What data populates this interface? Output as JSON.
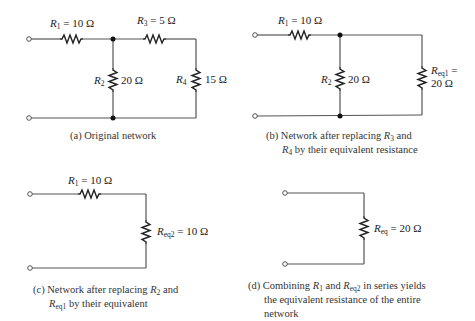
{
  "panels": [
    {
      "id": "a",
      "caption": "(a) Original network",
      "resistors": [
        {
          "name": "R1",
          "value": "10 Ω",
          "label": "R1 = 10 Ω"
        },
        {
          "name": "R2",
          "value": "20 Ω",
          "label": "R2 20 Ω"
        },
        {
          "name": "R3",
          "value": "5 Ω",
          "label": "R3 = 5 Ω"
        },
        {
          "name": "R4",
          "value": "15 Ω",
          "label": "R4 15 Ω"
        }
      ]
    },
    {
      "id": "b",
      "caption_line1": "(b) Network after replacing R3 and",
      "caption_line2": "R4 by their equivalent resistance",
      "resistors": [
        {
          "name": "R1",
          "value": "10 Ω"
        },
        {
          "name": "R2",
          "value": "20 Ω"
        },
        {
          "name": "Req1",
          "value": "20 Ω"
        }
      ]
    },
    {
      "id": "c",
      "caption_line1": "(c) Network after replacing R2 and",
      "caption_line2": "Req1 by their equivalent",
      "resistors": [
        {
          "name": "R1",
          "value": "10 Ω"
        },
        {
          "name": "Req2",
          "value": "10 Ω"
        }
      ]
    },
    {
      "id": "d",
      "caption_line1": "(d) Combining R1 and Req2 in series yields",
      "caption_line2": "the equivalent resistance of the entire",
      "caption_line3": "network",
      "resistors": [
        {
          "name": "Req",
          "value": "20 Ω"
        }
      ]
    }
  ],
  "labels": {
    "R": "R",
    "eq": "=",
    "sub1": "1",
    "sub2": "2",
    "sub3": "3",
    "sub4": "4",
    "subeq": "eq",
    "subeq1": "eq1",
    "subeq2": "eq2",
    "v10": "10 Ω",
    "v5": "5 Ω",
    "v20": "20 Ω",
    "v15": "15 Ω",
    "and": "and",
    "a_cap": "(a) Original network",
    "b_cap1_pre": "(b) Network after replacing ",
    "b_cap1_post": " and",
    "b_cap2_post": " by their equivalent resistance",
    "c_cap1_pre": "(c) Network after replacing ",
    "c_cap1_post": " and",
    "c_cap2_post": " by their equivalent",
    "d_cap1_pre": "(d) Combining ",
    "d_cap1_mid": " and ",
    "d_cap1_post": " in series yields",
    "d_cap2": "the equivalent resistance of the entire",
    "d_cap3": "network"
  }
}
